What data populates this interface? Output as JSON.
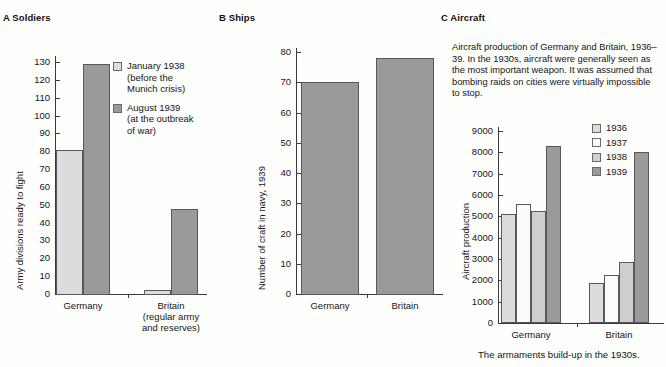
{
  "page": {
    "cut_heading": "45",
    "caption": "The armaments build-up in the 1930s."
  },
  "panels": {
    "a": {
      "title": "A Soldiers"
    },
    "b": {
      "title": "B Ships"
    },
    "c": {
      "title": "C Aircraft",
      "blurb": "Aircraft production of Germany and Britain, 1936–39. In the 1930s, aircraft were generally seen as the most important weapon. It was assumed that bombing raids on cities were virtually impossible to stop."
    }
  },
  "legend_a": [
    {
      "label": "January 1938 (before the Munich crisis)",
      "color": "#dcdcdc"
    },
    {
      "label": "August 1939 (at the outbreak of war)",
      "color": "#9a9a9a"
    }
  ],
  "legend_a_lines": {
    "item0_l1": "January 1938",
    "item0_l2": "(before the",
    "item0_l3": "Munich crisis)",
    "item1_l1": "August 1939",
    "item1_l2": "(at the outbreak",
    "item1_l3": "of war)"
  },
  "legend_c": [
    {
      "label": "1936",
      "color": "#dcdcdc"
    },
    {
      "label": "1937",
      "color": "#fbfbfa"
    },
    {
      "label": "1938",
      "color": "#cfcfcf"
    },
    {
      "label": "1939",
      "color": "#9a9a9a"
    }
  ],
  "ticks_a": [
    "130",
    "120",
    "110",
    "100",
    "90",
    "80",
    "70",
    "60",
    "50",
    "40",
    "30",
    "20",
    "10",
    "0"
  ],
  "ticks_b": [
    "80",
    "70",
    "60",
    "50",
    "40",
    "30",
    "20",
    "10",
    "0"
  ],
  "ticks_c": [
    "9000",
    "8000",
    "7000",
    "6000",
    "5000",
    "4000",
    "3000",
    "2000",
    "1000",
    "0"
  ],
  "cats_a": {
    "germany": "Germany",
    "britain_l1": "Britain",
    "britain_l2": "(regular army",
    "britain_l3": "and reserves)"
  },
  "cats_b": {
    "germany": "Germany",
    "britain": "Britain"
  },
  "cats_c": {
    "germany": "Germany",
    "britain": "Britain"
  },
  "chart_data": [
    {
      "id": "a",
      "type": "bar",
      "title": "A Soldiers",
      "xlabel": "",
      "ylabel": "Army divisions ready to fight",
      "ylim": [
        0,
        130
      ],
      "ytick_step": 10,
      "grid": false,
      "legend_position": "inside-right",
      "categories": [
        "Germany",
        "Britain (regular army and reserves)"
      ],
      "series": [
        {
          "name": "January 1938 (before the Munich crisis)",
          "color": "#dcdcdc",
          "values": [
            81,
            2
          ]
        },
        {
          "name": "August 1939 (at the outbreak of war)",
          "color": "#9a9a9a",
          "values": [
            129,
            48
          ]
        }
      ]
    },
    {
      "id": "b",
      "type": "bar",
      "title": "B Ships",
      "xlabel": "",
      "ylabel": "Number of craft in navy, 1939",
      "ylim": [
        0,
        80
      ],
      "ytick_step": 10,
      "grid": false,
      "legend_position": "none",
      "categories": [
        "Germany",
        "Britain"
      ],
      "values": [
        70,
        78
      ]
    },
    {
      "id": "c",
      "type": "bar",
      "title": "C Aircraft",
      "xlabel": "",
      "ylabel": "Aircraft production",
      "ylim": [
        0,
        9000
      ],
      "ytick_step": 1000,
      "grid": false,
      "legend_position": "inside-top-right",
      "categories": [
        "Germany",
        "Britain"
      ],
      "series": [
        {
          "name": "1936",
          "color": "#dcdcdc",
          "values": [
            5100,
            1900
          ]
        },
        {
          "name": "1937",
          "color": "#fbfbfa",
          "values": [
            5600,
            2250
          ]
        },
        {
          "name": "1938",
          "color": "#cfcfcf",
          "values": [
            5250,
            2850
          ]
        },
        {
          "name": "1939",
          "color": "#9a9a9a",
          "values": [
            8300,
            8000
          ]
        }
      ]
    }
  ]
}
